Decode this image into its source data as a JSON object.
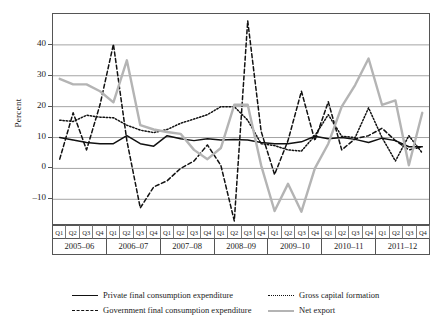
{
  "axis": {
    "ylabel": "Percent",
    "yticks": [
      "40",
      "30",
      "20",
      "10",
      "0",
      "–10"
    ]
  },
  "xaxis": {
    "quarters": [
      "Q1",
      "Q2",
      "Q3",
      "Q4",
      "Q1",
      "Q2",
      "Q3",
      "Q4",
      "Q1",
      "Q2",
      "Q3",
      "Q4",
      "Q1",
      "Q2",
      "Q3",
      "Q4",
      "Q1",
      "Q2",
      "Q3",
      "Q4",
      "Q1",
      "Q2",
      "Q3",
      "Q4",
      "Q1",
      "Q2",
      "Q3",
      "Q4"
    ],
    "years": [
      "2005–06",
      "2006–07",
      "2007–08",
      "2008–09",
      "2009–10",
      "2010–11",
      "2011–12"
    ]
  },
  "legend": [
    {
      "name": "private-final-consumption-expenditure",
      "label": "Private final consumption expenditure",
      "style": "s-solid",
      "color": "#111111"
    },
    {
      "name": "gross-capital-formation",
      "label": "Gross capital formation",
      "style": "s-dot",
      "color": "#111111"
    },
    {
      "name": "government-final-consumption-expenditure",
      "label": "Government final consumption expenditure",
      "style": "s-dash",
      "color": "#111111"
    },
    {
      "name": "net-export",
      "label": "Net export",
      "style": "s-gray",
      "color": "#b4b4b4"
    }
  ],
  "chart_data": {
    "type": "line",
    "title": "",
    "xlabel": "",
    "ylabel": "Percent",
    "ylim": [
      -18,
      50
    ],
    "yticks": [
      -10,
      0,
      10,
      20,
      30,
      40
    ],
    "grid": "horizontal",
    "legend_position": "bottom",
    "x": [
      "2005-06 Q1",
      "2005-06 Q2",
      "2005-06 Q3",
      "2005-06 Q4",
      "2006-07 Q1",
      "2006-07 Q2",
      "2006-07 Q3",
      "2006-07 Q4",
      "2007-08 Q1",
      "2007-08 Q2",
      "2007-08 Q3",
      "2007-08 Q4",
      "2008-09 Q1",
      "2008-09 Q2",
      "2008-09 Q3",
      "2008-09 Q4",
      "2009-10 Q1",
      "2009-10 Q2",
      "2009-10 Q3",
      "2009-10 Q4",
      "2010-11 Q1",
      "2010-11 Q2",
      "2010-11 Q3",
      "2010-11 Q4",
      "2011-12 Q1",
      "2011-12 Q2",
      "2011-12 Q3",
      "2011-12 Q4"
    ],
    "series": [
      {
        "name": "Private final consumption expenditure",
        "style": "solid",
        "color": "#111111",
        "values": [
          10.0,
          9.2,
          8.4,
          8.0,
          8.0,
          10.6,
          8.0,
          7.2,
          10.6,
          9.6,
          9.0,
          9.6,
          9.2,
          9.4,
          9.2,
          8.4,
          8.0,
          8.0,
          8.6,
          10.4,
          9.6,
          10.0,
          9.4,
          8.4,
          9.8,
          9.0,
          7.0,
          7.0
        ]
      },
      {
        "name": "Gross capital formation",
        "style": "dotted",
        "color": "#111111",
        "values": [
          15.6,
          15.2,
          17.2,
          16.6,
          16.4,
          14.0,
          12.4,
          11.6,
          12.6,
          14.6,
          16.0,
          17.4,
          20.0,
          20.0,
          15.6,
          8.0,
          7.4,
          6.0,
          5.6,
          10.6,
          17.4,
          10.4,
          10.0,
          19.6,
          10.0,
          2.4,
          10.6,
          5.0
        ]
      },
      {
        "name": "Government final consumption expenditure",
        "style": "dashed",
        "color": "#111111",
        "values": [
          3.0,
          18.0,
          6.0,
          20.6,
          40.2,
          9.0,
          -12.8,
          -6.0,
          -4.0,
          0.0,
          2.4,
          7.6,
          1.0,
          -17.0,
          47.8,
          12.0,
          -2.0,
          9.0,
          25.0,
          9.0,
          21.6,
          6.0,
          9.6,
          10.6,
          13.0,
          9.0,
          6.0,
          7.0
        ]
      },
      {
        "name": "Net export",
        "style": "solid-gray",
        "color": "#b4b4b4",
        "values": [
          29.0,
          27.2,
          27.2,
          25.0,
          21.4,
          35.0,
          14.0,
          12.6,
          11.8,
          11.2,
          6.0,
          3.0,
          6.6,
          20.6,
          20.6,
          1.0,
          -13.8,
          -5.0,
          -14.0,
          0.0,
          8.0,
          20.0,
          27.0,
          35.6,
          20.6,
          22.0,
          1.0,
          18.0
        ]
      }
    ]
  }
}
